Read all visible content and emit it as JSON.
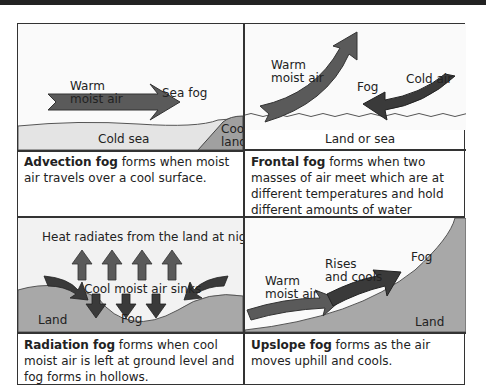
{
  "panels": {
    "advection": {
      "labels": {
        "air": "Warm\nmoist air",
        "air_line1": "Warm",
        "air_line2": "moist air",
        "fog": "Sea fog",
        "sea": "Cold sea",
        "land_line1": "Cool",
        "land_line2": "land"
      },
      "caption_bold": "Advection fog",
      "caption_rest": " forms when moist air travels over a cool surface."
    },
    "frontal": {
      "labels": {
        "air_line1": "Warm",
        "air_line2": "moist air",
        "fog": "Fog",
        "cold": "Cold air",
        "ground": "Land or sea"
      },
      "caption_bold": "Frontal fog",
      "caption_rest": " forms when two masses of air meet which are at different temperatures and hold different amounts of water vapour."
    },
    "radiation": {
      "labels": {
        "heat": "Heat radiates from the land at night",
        "sinks": "Cool moist air sinks",
        "land": "Land",
        "fog": "Fog"
      },
      "caption_bold": "Radiation fog",
      "caption_rest": " forms when cool moist air is left at ground level and fog forms in hollows."
    },
    "upslope": {
      "labels": {
        "air_line1": "Warm",
        "air_line2": "moist air",
        "rises_line1": "Rises",
        "rises_line2": "and cools",
        "fog": "Fog",
        "land": "Land"
      },
      "caption_bold": "Upslope fog",
      "caption_rest": " forms as the air moves uphill and cools."
    }
  },
  "colors": {
    "arrow": "#5a5a5a",
    "arrow_dark": "#3a3a3a",
    "land": "#a8a8a8",
    "sea": "#e6e6e6",
    "border": "#333333"
  }
}
